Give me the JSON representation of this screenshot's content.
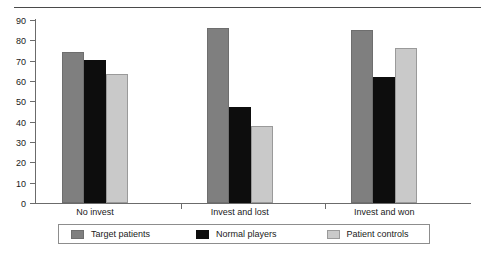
{
  "chart_data": {
    "type": "bar",
    "title": "",
    "subtitle": "",
    "xlabel": "",
    "ylabel": "",
    "categories": [
      "No invest",
      "Invest and lost",
      "Invest and won"
    ],
    "series": [
      {
        "name": "Target patients",
        "color": "#7f7f7f",
        "values": [
          74.5,
          86.0,
          85.0
        ]
      },
      {
        "name": "Normal players",
        "color": "#0d0d0d",
        "values": [
          70.5,
          47.0,
          62.0
        ]
      },
      {
        "name": "Patient controls",
        "color": "#c9c9c9",
        "values": [
          63.5,
          38.0,
          76.0
        ]
      }
    ],
    "ylim": [
      0,
      90
    ],
    "yticks": [
      0,
      10,
      20,
      30,
      40,
      50,
      60,
      70,
      80,
      90
    ],
    "ytick_labels": [
      "0",
      "10",
      "20",
      "30",
      "40",
      "50",
      "60",
      "70",
      "80",
      "90"
    ],
    "grid": false,
    "legend_position": "bottom",
    "axis_color": "#6b6b6b",
    "background": "#ffffff"
  }
}
